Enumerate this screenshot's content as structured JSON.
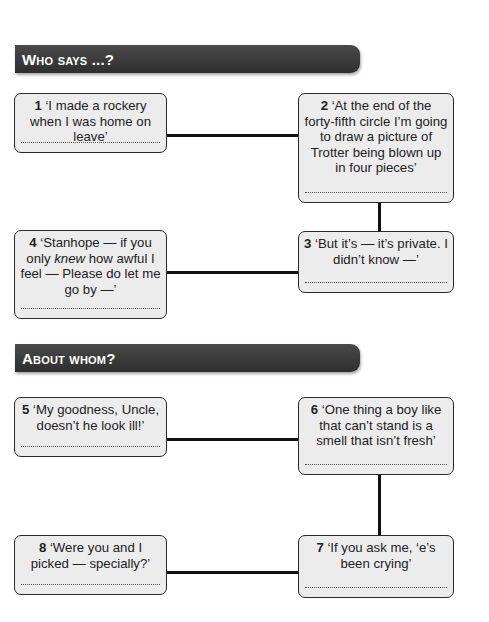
{
  "sections": [
    {
      "title": "Who says ...?",
      "questions": [
        {
          "number": "1",
          "quote": "‘I made a rockery when I was home on leave’"
        },
        {
          "number": "2",
          "quote": "‘At the end of the forty-fifth circle I’m going to draw a picture of Trotter being blown up in four pieces’"
        },
        {
          "number": "3",
          "quote": "‘But it’s — it’s private. I didn’t know —’"
        },
        {
          "number": "4",
          "quote_before": "‘Stanhope — if you only ",
          "quote_italic": "knew",
          "quote_after": " how awful I feel — Please do let me go by —’"
        }
      ]
    },
    {
      "title": "About whom?",
      "questions": [
        {
          "number": "5",
          "quote": "‘My goodness, Uncle, doesn’t he look ill!’"
        },
        {
          "number": "6",
          "quote": "‘One thing a boy like that can’t stand is a smell that isn’t fresh’"
        },
        {
          "number": "7",
          "quote": "‘If you ask me, ‘e’s been crying’"
        },
        {
          "number": "8",
          "quote": "‘Were you and I picked — specially?’"
        }
      ]
    }
  ],
  "colors": {
    "header_bg": "#3a3a3a",
    "box_bg": "#ececec",
    "box_border": "#2a2a2a",
    "connector": "#111111"
  }
}
